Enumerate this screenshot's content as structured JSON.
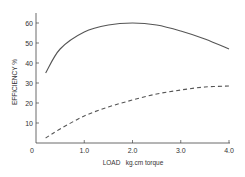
{
  "chart_data": {
    "type": "line",
    "title": "",
    "xlabel": "LOAD   kg.cm torque",
    "ylabel": "EFFICIENCY %",
    "xlim": [
      0,
      4.0
    ],
    "ylim": [
      0,
      65
    ],
    "x_ticks": [
      "0",
      "1.0",
      "2.0",
      "3.0",
      "4.0"
    ],
    "y_ticks": [
      "10",
      "20",
      "30",
      "40",
      "50",
      "60"
    ],
    "grid": false,
    "legend": null,
    "series": [
      {
        "name": "solid",
        "style": "solid",
        "x": [
          0.2,
          0.5,
          1.0,
          1.5,
          2.0,
          2.5,
          3.0,
          3.5,
          4.0
        ],
        "values": [
          35,
          47,
          55.5,
          59,
          60,
          59,
          56,
          52,
          47
        ]
      },
      {
        "name": "dashed",
        "style": "dashed",
        "x": [
          0.2,
          0.5,
          1.0,
          1.5,
          2.0,
          2.5,
          3.0,
          3.5,
          4.0
        ],
        "values": [
          2.5,
          7,
          13.5,
          18,
          21.5,
          24.5,
          26.5,
          28,
          28.5
        ]
      }
    ]
  },
  "colors": {
    "line": "#555555",
    "axis": "#444444"
  }
}
